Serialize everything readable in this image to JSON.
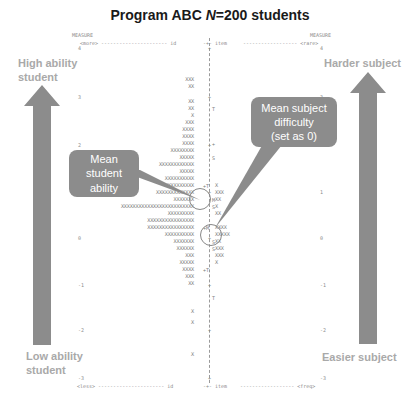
{
  "title": {
    "prefix": "Program ABC ",
    "n_symbol": "N",
    "suffix": "=200 students"
  },
  "header": {
    "left_measure": "MEASURE",
    "left_more": "<more> ---------------------- id",
    "center_top": "-+- item",
    "right_dashes": "------------------ <rare>",
    "right_measure": "MEASURE"
  },
  "footer": {
    "left_less": "<less> ---------------------- id",
    "center_bottom": "-+- item",
    "right_dashes": "------------------ <freq>"
  },
  "axis": {
    "left_ticks": [
      "4",
      "3",
      "2",
      "1",
      "0",
      "-1",
      "-2",
      "-3"
    ],
    "right_ticks": [
      "4",
      "3",
      "2",
      "1",
      "0",
      "-1",
      "-2",
      "-3"
    ]
  },
  "labels": {
    "high_ability": "High ability student",
    "low_ability": "Low ability student",
    "harder_subject": "Harder subject",
    "easier_subject": "Easier subject"
  },
  "callouts": {
    "student": {
      "line1": "Mean",
      "line2": "student",
      "line3": "ability"
    },
    "subject": {
      "line1": "Mean subject",
      "line2": "difficulty",
      "line3": "(set as 0)"
    }
  },
  "colors": {
    "arrow": "#8c8c8c",
    "callout": "#8c8c8c",
    "label": "#a9a9a9"
  },
  "map_rows": [
    {
      "y": 77,
      "persons": "XXX",
      "marker": "",
      "items": ""
    },
    {
      "y": 84,
      "persons": "XX",
      "marker": "",
      "items": ""
    },
    {
      "y": 99,
      "persons": "XX",
      "marker": "",
      "items": ""
    },
    {
      "y": 106,
      "persons": "XX",
      "marker": "T",
      "items": ""
    },
    {
      "y": 113,
      "persons": "X",
      "marker": "",
      "items": ""
    },
    {
      "y": 120,
      "persons": "XXX",
      "marker": "",
      "items": ""
    },
    {
      "y": 127,
      "persons": "XXXX",
      "marker": "",
      "items": ""
    },
    {
      "y": 134,
      "persons": "XXXX",
      "marker": "",
      "items": ""
    },
    {
      "y": 141,
      "persons": "XXXX",
      "marker": "+",
      "items": ""
    },
    {
      "y": 148,
      "persons": "XXXXXXXX",
      "marker": "",
      "items": ""
    },
    {
      "y": 155,
      "persons": "XXXXX",
      "marker": "S",
      "items": ""
    },
    {
      "y": 162,
      "persons": "XXXXXXXXXXXX",
      "marker": "",
      "items": ""
    },
    {
      "y": 169,
      "persons": "XXXXX",
      "marker": "",
      "items": ""
    },
    {
      "y": 176,
      "persons": "XXXXXXXXXX",
      "marker": "",
      "items": ""
    },
    {
      "y": 183,
      "persons": "XXXXXXXXXX",
      "marker": "+T",
      "items": "X"
    },
    {
      "y": 190,
      "persons": "XXXXXXXXXXXXX",
      "marker": "",
      "items": "XXX"
    },
    {
      "y": 197,
      "persons": "XXXXXXX",
      "marker": "M",
      "items": "XX"
    },
    {
      "y": 204,
      "persons": "XXXXXXXXXXXXXXXXXXXXXXXXX",
      "marker": "S",
      "items": "X"
    },
    {
      "y": 211,
      "persons": "XXXXXXXXX",
      "marker": "",
      "items": "XX"
    },
    {
      "y": 218,
      "persons": "XXXXXXXXXXXXXXXX",
      "marker": "",
      "items": ""
    },
    {
      "y": 225,
      "persons": "XXXXXXXXXXXXXXXX",
      "marker": "+M",
      "items": "XXXX"
    },
    {
      "y": 232,
      "persons": "XXXXXXXXXX",
      "marker": "",
      "items": "XXXXX"
    },
    {
      "y": 239,
      "persons": "XXXXXXX",
      "marker": "S",
      "items": "XX"
    },
    {
      "y": 246,
      "persons": "XXXXXX",
      "marker": "S",
      "items": "XXX"
    },
    {
      "y": 253,
      "persons": "XXX",
      "marker": "",
      "items": "XXX"
    },
    {
      "y": 260,
      "persons": "XXXXX",
      "marker": "",
      "items": "X"
    },
    {
      "y": 267,
      "persons": "XXXX",
      "marker": "+T",
      "items": ""
    },
    {
      "y": 274,
      "persons": "XXX",
      "marker": "",
      "items": ""
    },
    {
      "y": 281,
      "persons": "XX",
      "marker": "",
      "items": ""
    },
    {
      "y": 295,
      "persons": "",
      "marker": "T",
      "items": ""
    },
    {
      "y": 309,
      "persons": "X",
      "marker": "",
      "items": ""
    },
    {
      "y": 320,
      "persons": "X",
      "marker": "",
      "items": ""
    },
    {
      "y": 352,
      "persons": "X",
      "marker": "",
      "items": ""
    }
  ]
}
